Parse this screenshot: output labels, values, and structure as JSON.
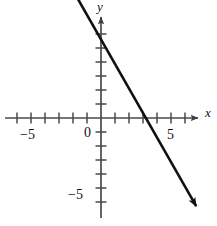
{
  "figure": {
    "kind": "coordinate-plane-line-graph",
    "background_color": "#ffffff",
    "ink_color": "#1a1a1a",
    "axis_color": "#4a4a4a"
  },
  "labels": {
    "x_axis": "x",
    "y_axis": "y",
    "x_neg5": "−5",
    "x_origin": "0",
    "x_pos5": "5",
    "y_neg5": "−5"
  },
  "chart_data": {
    "type": "line",
    "title": "",
    "xlabel": "x",
    "ylabel": "y",
    "grid": false,
    "legend": null,
    "xlim": [
      -7,
      8
    ],
    "ylim": [
      -7.7,
      7.2
    ],
    "xticks": [
      -6,
      -5,
      -4,
      -3,
      -2,
      -1,
      0,
      1,
      2,
      3,
      4,
      5,
      6
    ],
    "yticks": [
      -6,
      -5,
      -4,
      -3,
      -2,
      -1,
      0,
      1,
      2,
      3,
      4,
      5,
      6
    ],
    "xtick_labels": [
      "-5",
      "0",
      "5"
    ],
    "ytick_labels": [
      "-5"
    ],
    "series": [
      {
        "name": "line",
        "slope": -1.75,
        "intercept": 5.6,
        "equation": "y = -1.75x + 5.6",
        "x_intercept": 3.2,
        "y_intercept": 5.6,
        "x": [
          -1.65,
          6.8
        ],
        "y": [
          8.5,
          -6.3
        ],
        "arrow_start": true,
        "arrow_end": true
      }
    ]
  }
}
